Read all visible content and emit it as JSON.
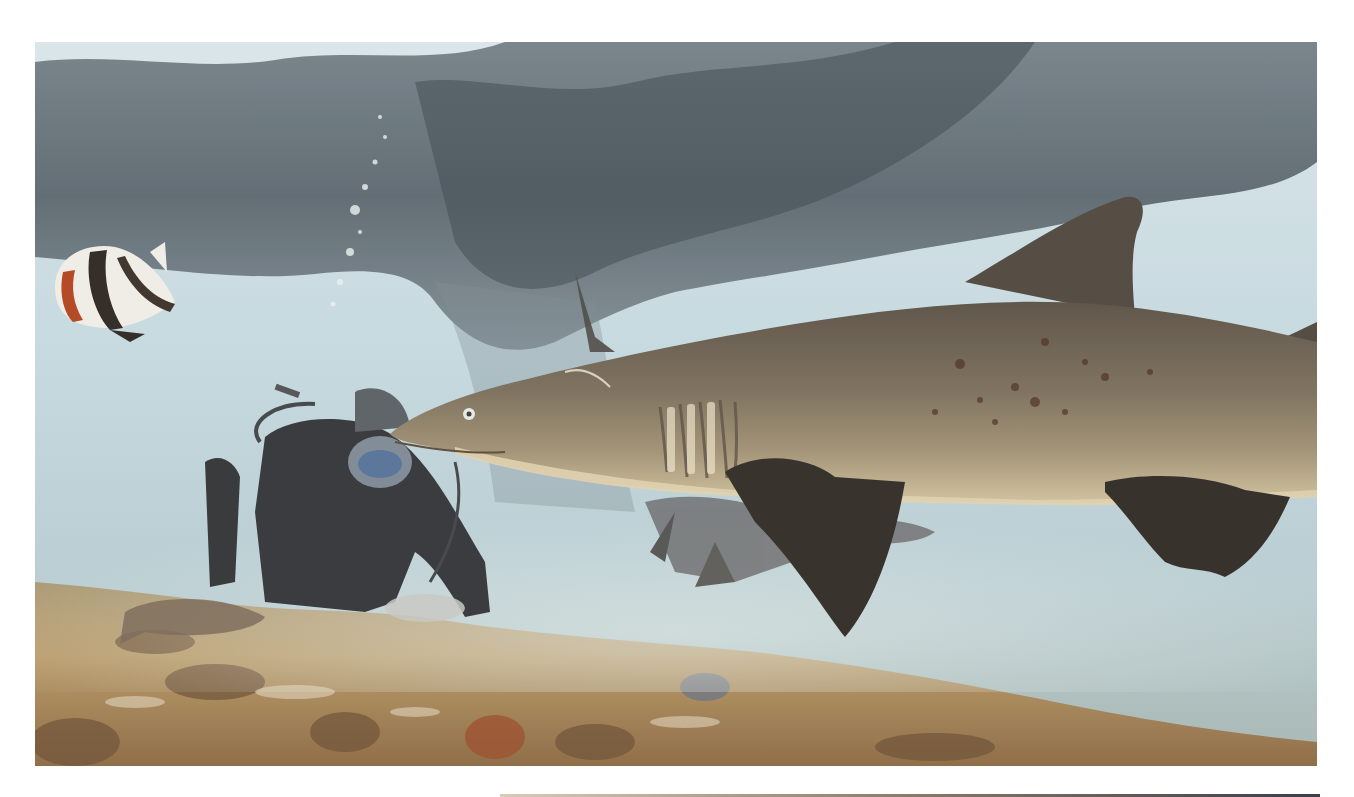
{
  "image": {
    "description": "Underwater photograph: a sand tiger shark swims right-to-left in the foreground past a scuba diver crouching on a rocky, algae-covered seabed beneath a dark overhanging reef/pier structure; a black-white-orange bannerfish (butterflyfish) swims at upper left, a grouper-like fish rests on the rocks at lower left, and a second shark is partially visible behind the first.",
    "subjects": [
      "sand-tiger-shark",
      "scuba-diver",
      "bannerfish",
      "second-shark",
      "reef-fish",
      "rocky-seabed",
      "overhanging-reef"
    ],
    "palette": {
      "water_light": "#cfe3ea",
      "water_mid": "#a9c4d2",
      "overhang": "#4a5560",
      "shark_back": "#6b6153",
      "shark_belly": "#cdbf9c",
      "fin_dark": "#2e2a26",
      "seabed": "#b89a68",
      "seabed_dark": "#6e5236",
      "page_bg": "#ffffff"
    }
  }
}
